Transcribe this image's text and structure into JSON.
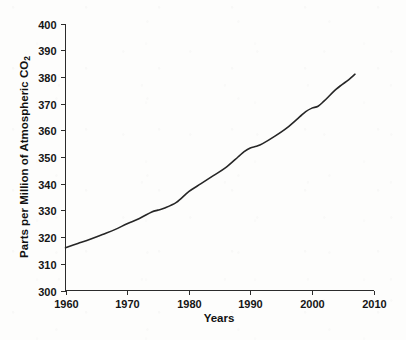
{
  "chart_data": {
    "type": "line",
    "title": "",
    "xlabel": "Years",
    "ylabel": "Parts per Million of Atmospheric CO",
    "ylabel_subscript": "2",
    "xlim": [
      1960,
      2010
    ],
    "ylim": [
      300,
      400
    ],
    "xticks": [
      1960,
      1970,
      1980,
      1990,
      2000,
      2010
    ],
    "yticks": [
      300,
      310,
      320,
      330,
      340,
      350,
      360,
      370,
      380,
      390,
      400
    ],
    "grid": false,
    "legend": false,
    "series": [
      {
        "name": "Atmospheric CO2",
        "x": [
          1960,
          1962,
          1964,
          1966,
          1968,
          1970,
          1972,
          1974,
          1975,
          1976,
          1978,
          1980,
          1982,
          1984,
          1986,
          1988,
          1989,
          1990,
          1991,
          1992,
          1994,
          1996,
          1998,
          1999,
          2000,
          2001,
          2002,
          2004,
          2006,
          2007
        ],
        "values": [
          316.0,
          317.6,
          319.2,
          321.0,
          322.8,
          325.0,
          327.0,
          329.4,
          330.1,
          330.8,
          333.0,
          337.0,
          340.0,
          343.0,
          346.0,
          350.0,
          352.0,
          353.4,
          354.0,
          355.0,
          357.8,
          361.0,
          365.0,
          367.0,
          368.3,
          369.0,
          371.0,
          375.5,
          379.0,
          381.0
        ]
      }
    ]
  },
  "axis": {
    "x_tick_labels": [
      "1960",
      "1970",
      "1980",
      "1990",
      "2000",
      "2010"
    ],
    "y_tick_labels": [
      "300",
      "310",
      "320",
      "330",
      "340",
      "350",
      "360",
      "370",
      "380",
      "390",
      "400"
    ]
  },
  "colors": {
    "line": "#262626",
    "axis": "#2b2b2b",
    "background": "#fdfdfc",
    "text": "#151515"
  }
}
